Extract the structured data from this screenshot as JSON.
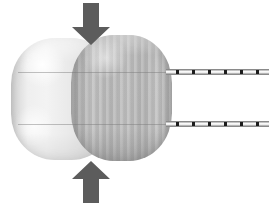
{
  "figure": {
    "background_color": "#ffffff",
    "width": 269,
    "height": 204
  },
  "balloons": [
    {
      "id": "balloon-left",
      "label": "Uncompressed translucent balloon (left)",
      "fill_color": "#ebebeb",
      "edge_color": "#bdbdbd",
      "x": 11,
      "y": 38,
      "width": 104,
      "height": 122
    },
    {
      "id": "balloon-right",
      "label": "Shaded balloon with vertical striations (right)",
      "fill_color": "#b8b8b8",
      "edge_color": "#9e9e9e",
      "x": 71,
      "y": 35,
      "width": 101,
      "height": 126
    }
  ],
  "seams": [
    {
      "id": "seam-upper",
      "label": "Upper equatorial seam line",
      "color": "#787878",
      "y": 72
    },
    {
      "id": "seam-lower",
      "label": "Lower equatorial seam line",
      "color": "#787878",
      "y": 124
    }
  ],
  "rods": [
    {
      "id": "rod-upper",
      "label": "Upper graduated catheter shaft",
      "shaft_color": "#f0f0f0",
      "tick_color": "#1c1c1c",
      "x": 166,
      "y": 69,
      "length": 103,
      "tick_count": 6,
      "tick_positions": [
        10,
        26,
        42,
        58,
        74,
        90
      ]
    },
    {
      "id": "rod-lower",
      "label": "Lower graduated catheter shaft",
      "shaft_color": "#f0f0f0",
      "tick_color": "#1c1c1c",
      "x": 166,
      "y": 121,
      "length": 103,
      "tick_count": 6,
      "tick_positions": [
        10,
        26,
        42,
        58,
        74,
        90
      ]
    }
  ],
  "arrows": [
    {
      "id": "arrow-down",
      "label": "Downward compression force arrow",
      "direction": "down",
      "color": "#5c5c5c",
      "x": 71,
      "y": 3,
      "width": 40,
      "height": 42
    },
    {
      "id": "arrow-up",
      "label": "Upward compression force arrow",
      "direction": "up",
      "color": "#5c5c5c",
      "x": 71,
      "y": 161,
      "width": 40,
      "height": 42
    }
  ]
}
